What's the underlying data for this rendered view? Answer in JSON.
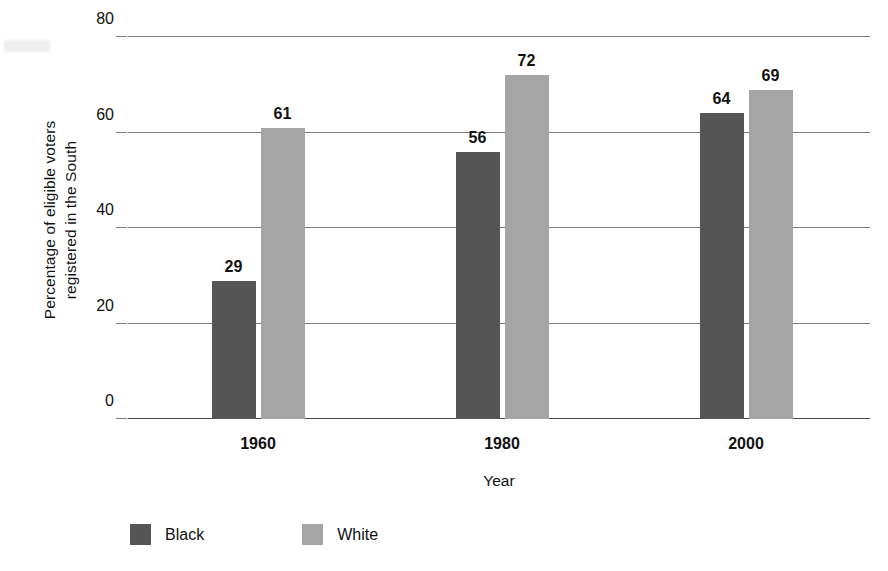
{
  "chart_data": {
    "type": "bar",
    "title": "",
    "subtitle": "",
    "xlabel": "Year",
    "ylabel": "Percentage of eligible voters registered in the South",
    "ylabel_lines": [
      "Percentage of eligible voters",
      "registered in the South"
    ],
    "categories": [
      "1960",
      "1980",
      "2000"
    ],
    "series": [
      {
        "name": "Black",
        "values": [
          29,
          56,
          64
        ],
        "color": "#555555"
      },
      {
        "name": "White",
        "values": [
          61,
          72,
          69
        ],
        "color": "#a5a5a5"
      }
    ],
    "ylim": [
      0,
      80
    ],
    "yticks": [
      0,
      20,
      40,
      60,
      80
    ],
    "ytick_labels": [
      "0",
      "20",
      "40",
      "60",
      "80"
    ],
    "grid": "horizontal",
    "legend_position": "bottom-left",
    "data_labels": true,
    "data_label_values": [
      "29",
      "61",
      "56",
      "72",
      "64",
      "69"
    ]
  },
  "legend": {
    "items": [
      {
        "label": "Black",
        "color": "#555555"
      },
      {
        "label": "White",
        "color": "#a5a5a5"
      }
    ]
  },
  "axes": {
    "x_title": "Year",
    "y_title_line1": "Percentage of eligible voters",
    "y_title_line2": "registered in the South"
  }
}
